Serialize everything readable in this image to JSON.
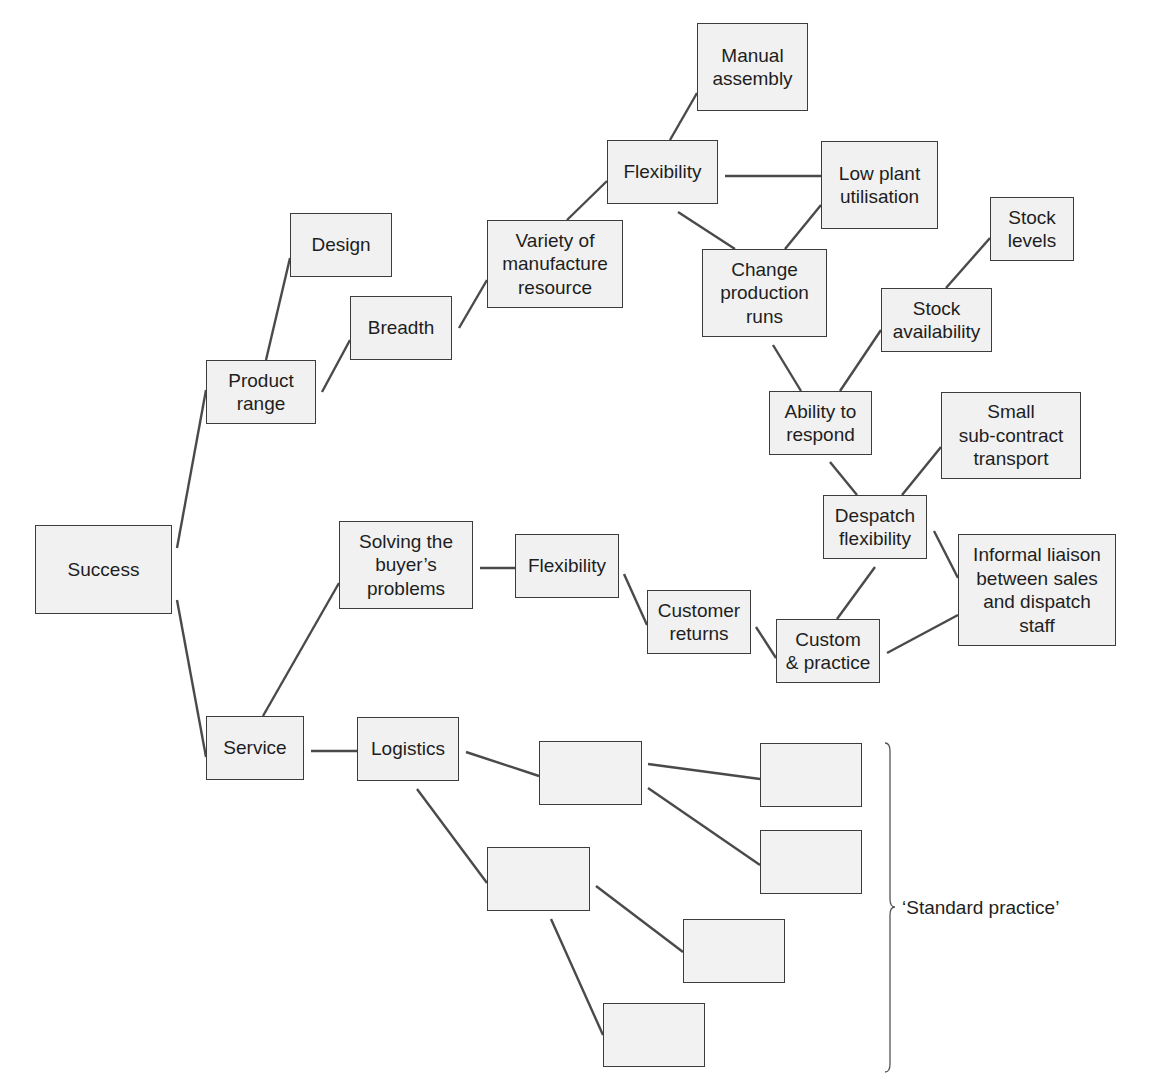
{
  "diagram": {
    "type": "tree / relationship map",
    "root": "Success",
    "nodes": [
      {
        "id": "success",
        "label": "Success",
        "x": 35,
        "y": 525,
        "w": 137,
        "h": 89
      },
      {
        "id": "product_range",
        "label": "Product\nrange",
        "x": 206,
        "y": 360,
        "w": 110,
        "h": 64
      },
      {
        "id": "design",
        "label": "Design",
        "x": 290,
        "y": 213,
        "w": 102,
        "h": 64
      },
      {
        "id": "breadth",
        "label": "Breadth",
        "x": 350,
        "y": 296,
        "w": 102,
        "h": 64
      },
      {
        "id": "variety",
        "label": "Variety of\nmanufacture\nresource",
        "x": 487,
        "y": 220,
        "w": 136,
        "h": 88
      },
      {
        "id": "flexibility_1",
        "label": "Flexibility",
        "x": 607,
        "y": 140,
        "w": 111,
        "h": 64
      },
      {
        "id": "manual_assembly",
        "label": "Manual\nassembly",
        "x": 697,
        "y": 23,
        "w": 111,
        "h": 88
      },
      {
        "id": "low_plant",
        "label": "Low plant\nutilisation",
        "x": 821,
        "y": 141,
        "w": 117,
        "h": 88
      },
      {
        "id": "change_production",
        "label": "Change\nproduction\nruns",
        "x": 702,
        "y": 249,
        "w": 125,
        "h": 88
      },
      {
        "id": "stock_levels",
        "label": "Stock\nlevels",
        "x": 990,
        "y": 197,
        "w": 84,
        "h": 64
      },
      {
        "id": "stock_availability",
        "label": "Stock\navailability",
        "x": 881,
        "y": 288,
        "w": 111,
        "h": 64
      },
      {
        "id": "ability_respond",
        "label": "Ability to\nrespond",
        "x": 769,
        "y": 391,
        "w": 103,
        "h": 64
      },
      {
        "id": "small_subcontract",
        "label": "Small\nsub-contract\ntransport",
        "x": 941,
        "y": 392,
        "w": 140,
        "h": 87
      },
      {
        "id": "despatch_flex",
        "label": "Despatch\nflexibility",
        "x": 823,
        "y": 495,
        "w": 104,
        "h": 64
      },
      {
        "id": "informal_liaison",
        "label": "Informal liaison\nbetween sales\nand dispatch\nstaff",
        "x": 958,
        "y": 534,
        "w": 158,
        "h": 112
      },
      {
        "id": "custom_practice",
        "label": "Custom\n& practice",
        "x": 776,
        "y": 619,
        "w": 104,
        "h": 64
      },
      {
        "id": "solving",
        "label": "Solving the\nbuyer’s\nproblems",
        "x": 339,
        "y": 521,
        "w": 134,
        "h": 88
      },
      {
        "id": "flexibility_2",
        "label": "Flexibility",
        "x": 515,
        "y": 534,
        "w": 104,
        "h": 64
      },
      {
        "id": "customer_returns",
        "label": "Customer\nreturns",
        "x": 647,
        "y": 590,
        "w": 104,
        "h": 64
      },
      {
        "id": "service",
        "label": "Service",
        "x": 206,
        "y": 716,
        "w": 98,
        "h": 64
      },
      {
        "id": "logistics",
        "label": "Logistics",
        "x": 357,
        "y": 717,
        "w": 102,
        "h": 64
      },
      {
        "id": "blank_a",
        "label": "",
        "x": 539,
        "y": 741,
        "w": 103,
        "h": 64
      },
      {
        "id": "blank_b",
        "label": "",
        "x": 487,
        "y": 847,
        "w": 103,
        "h": 64
      },
      {
        "id": "blank_c",
        "label": "",
        "x": 760,
        "y": 743,
        "w": 102,
        "h": 64
      },
      {
        "id": "blank_d",
        "label": "",
        "x": 760,
        "y": 830,
        "w": 102,
        "h": 64
      },
      {
        "id": "blank_e",
        "label": "",
        "x": 683,
        "y": 919,
        "w": 102,
        "h": 64
      },
      {
        "id": "blank_f",
        "label": "",
        "x": 603,
        "y": 1003,
        "w": 102,
        "h": 64
      }
    ],
    "edges": [
      {
        "from": "success",
        "to": "product_range",
        "x1": 177,
        "y1": 548,
        "x2": 206,
        "y2": 390
      },
      {
        "from": "success",
        "to": "service",
        "x1": 177,
        "y1": 600,
        "x2": 206,
        "y2": 757
      },
      {
        "from": "product_range",
        "to": "design",
        "x1": 266,
        "y1": 360,
        "x2": 290,
        "y2": 258
      },
      {
        "from": "product_range",
        "to": "breadth",
        "x1": 322,
        "y1": 392,
        "x2": 350,
        "y2": 340
      },
      {
        "from": "breadth",
        "to": "variety",
        "x1": 459,
        "y1": 328,
        "x2": 487,
        "y2": 280
      },
      {
        "from": "variety",
        "to": "flexibility_1",
        "x1": 567,
        "y1": 220,
        "x2": 607,
        "y2": 181
      },
      {
        "from": "flexibility_1",
        "to": "manual_assembly",
        "x1": 670,
        "y1": 140,
        "x2": 697,
        "y2": 93
      },
      {
        "from": "flexibility_1",
        "to": "low_plant",
        "x1": 725,
        "y1": 176,
        "x2": 821,
        "y2": 176
      },
      {
        "from": "flexibility_1",
        "to": "change_production",
        "x1": 678,
        "y1": 212,
        "x2": 735,
        "y2": 249
      },
      {
        "from": "low_plant",
        "to": "change_production",
        "x1": 821,
        "y1": 205,
        "x2": 785,
        "y2": 249
      },
      {
        "from": "change_production",
        "to": "ability_respond",
        "x1": 773,
        "y1": 345,
        "x2": 801,
        "y2": 391
      },
      {
        "from": "ability_respond",
        "to": "stock_availability",
        "x1": 840,
        "y1": 391,
        "x2": 881,
        "y2": 330
      },
      {
        "from": "stock_availability",
        "to": "stock_levels",
        "x1": 946,
        "y1": 288,
        "x2": 990,
        "y2": 238
      },
      {
        "from": "ability_respond",
        "to": "despatch_flex",
        "x1": 830,
        "y1": 462,
        "x2": 857,
        "y2": 495
      },
      {
        "from": "despatch_flex",
        "to": "small_subcontract",
        "x1": 902,
        "y1": 495,
        "x2": 941,
        "y2": 447
      },
      {
        "from": "despatch_flex",
        "to": "informal_liaison",
        "x1": 934,
        "y1": 531,
        "x2": 958,
        "y2": 578
      },
      {
        "from": "despatch_flex",
        "to": "custom_practice",
        "x1": 875,
        "y1": 567,
        "x2": 837,
        "y2": 619
      },
      {
        "from": "custom_practice",
        "to": "informal_liaison",
        "x1": 887,
        "y1": 653,
        "x2": 958,
        "y2": 615
      },
      {
        "from": "service",
        "to": "solving",
        "x1": 263,
        "y1": 716,
        "x2": 339,
        "y2": 583
      },
      {
        "from": "solving",
        "to": "flexibility_2",
        "x1": 480,
        "y1": 568,
        "x2": 515,
        "y2": 568
      },
      {
        "from": "flexibility_2",
        "to": "customer_returns",
        "x1": 624,
        "y1": 574,
        "x2": 647,
        "y2": 625
      },
      {
        "from": "customer_returns",
        "to": "custom_practice",
        "x1": 756,
        "y1": 627,
        "x2": 776,
        "y2": 658
      },
      {
        "from": "service",
        "to": "logistics",
        "x1": 311,
        "y1": 751,
        "x2": 357,
        "y2": 751
      },
      {
        "from": "logistics",
        "to": "blank_a",
        "x1": 466,
        "y1": 752,
        "x2": 539,
        "y2": 776
      },
      {
        "from": "logistics",
        "to": "blank_b",
        "x1": 417,
        "y1": 789,
        "x2": 487,
        "y2": 883
      },
      {
        "from": "blank_a",
        "to": "blank_c",
        "x1": 648,
        "y1": 764,
        "x2": 760,
        "y2": 779
      },
      {
        "from": "blank_a",
        "to": "blank_d",
        "x1": 648,
        "y1": 788,
        "x2": 760,
        "y2": 865
      },
      {
        "from": "blank_b",
        "to": "blank_e",
        "x1": 596,
        "y1": 886,
        "x2": 683,
        "y2": 952
      },
      {
        "from": "blank_b",
        "to": "blank_f",
        "x1": 551,
        "y1": 919,
        "x2": 603,
        "y2": 1035
      }
    ],
    "annotation": {
      "text": "‘Standard practice’",
      "brace_top": 743,
      "brace_bottom": 1072,
      "brace_x": 885,
      "brace_point_y": 907,
      "text_x": 902,
      "text_y": 896
    },
    "colors": {
      "box_fill": "#f1f1f1",
      "box_border": "#3c3c3c",
      "line": "#4a4a4a",
      "text": "#1e1e1e",
      "background": "#ffffff"
    }
  }
}
